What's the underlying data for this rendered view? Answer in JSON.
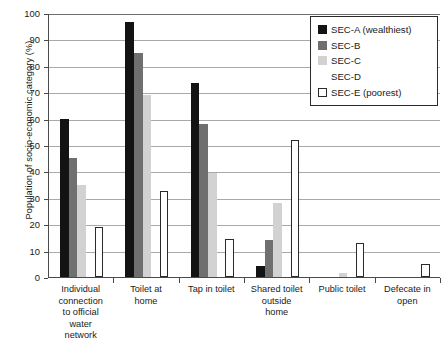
{
  "chart_data": {
    "type": "bar",
    "title": "",
    "xlabel": "",
    "ylabel": "Population of socio-economic category (%)",
    "ylim": [
      0,
      100
    ],
    "ytick_step": 10,
    "yticks": [
      "100",
      "90",
      "80",
      "70",
      "60",
      "50",
      "40",
      "30",
      "20",
      "10",
      "0"
    ],
    "grid": true,
    "legend_position": "top-right",
    "categories": [
      "Individual connection to official water network",
      "Toilet at home",
      "Tap in toilet",
      "Shared toilet outside home",
      "Public toilet",
      "Defecate in open"
    ],
    "category_lines": [
      [
        "Individual",
        "connection",
        "to official",
        "water",
        "network"
      ],
      [
        "Toilet at",
        "home"
      ],
      [
        "Tap in toilet"
      ],
      [
        "Shared toilet",
        "outside",
        "home"
      ],
      [
        "Public toilet"
      ],
      [
        "Defecate in",
        "open"
      ]
    ],
    "series": [
      {
        "name": "SEC-A (wealthiest)",
        "color": "#131313",
        "values": [
          60,
          96.5,
          73.5,
          4,
          0,
          0
        ]
      },
      {
        "name": "SEC-B",
        "color": "#6f6f6f",
        "values": [
          45,
          85,
          58,
          14,
          0,
          0
        ]
      },
      {
        "name": "SEC-C",
        "color": "#d2d2d2",
        "values": [
          35,
          69,
          39.5,
          28,
          1.5,
          0
        ]
      },
      {
        "name": "SEC-D",
        "color": "#fdfdfd",
        "values": [
          0,
          0,
          0,
          0,
          0,
          0
        ]
      },
      {
        "name": "SEC-E (poorest)",
        "color": "#ffffff",
        "values": [
          19,
          32.5,
          14.5,
          52,
          13,
          5
        ]
      }
    ]
  },
  "legend": {
    "items": [
      {
        "label": "SEC-A (wealthiest)",
        "swatch": "sw-a"
      },
      {
        "label": "SEC-B",
        "swatch": "sw-b"
      },
      {
        "label": "SEC-C",
        "swatch": "sw-c"
      },
      {
        "label": "SEC-D",
        "swatch": "sw-d"
      },
      {
        "label": "SEC-E (poorest)",
        "swatch": "sw-e"
      }
    ]
  }
}
